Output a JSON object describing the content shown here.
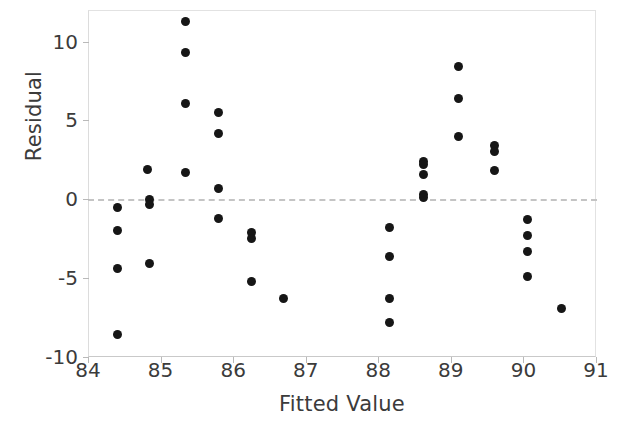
{
  "chart_data": {
    "type": "scatter",
    "title": "",
    "xlabel": "Fitted Value",
    "ylabel": "Residual",
    "xlim": [
      84,
      91
    ],
    "ylim": [
      -10,
      12
    ],
    "xticks": [
      84,
      85,
      86,
      87,
      88,
      89,
      90,
      91
    ],
    "xticklabels": [
      "84",
      "85",
      "86",
      "87",
      "88",
      "89",
      "90",
      "91"
    ],
    "yticks": [
      -10,
      -5,
      0,
      5,
      10
    ],
    "yticklabels": [
      "-10",
      "-5",
      "0",
      "5",
      "10"
    ],
    "grid": false,
    "reference_line": {
      "axis": "y",
      "value": 0,
      "style": "dashed",
      "color": "#c4c4c4"
    },
    "marker": {
      "shape": "circle",
      "color": "#161616",
      "size": 9
    },
    "x": [
      84.4,
      84.4,
      84.4,
      84.4,
      84.82,
      84.85,
      84.85,
      84.85,
      85.35,
      85.35,
      85.35,
      85.35,
      85.8,
      85.8,
      85.8,
      85.8,
      86.25,
      86.25,
      86.25,
      86.7,
      88.15,
      88.15,
      88.15,
      88.15,
      88.62,
      88.62,
      88.62,
      88.62,
      88.62,
      89.1,
      89.1,
      89.1,
      89.6,
      89.6,
      89.6,
      90.05,
      90.05,
      90.05,
      90.05,
      90.52
    ],
    "y": [
      -0.5,
      -2.0,
      -4.4,
      -8.6,
      1.9,
      0.0,
      -0.3,
      -4.1,
      11.3,
      9.3,
      6.1,
      1.7,
      5.5,
      4.2,
      0.7,
      -1.2,
      -2.1,
      -2.5,
      -5.2,
      -6.3,
      -1.8,
      -3.6,
      -6.3,
      -7.8,
      2.4,
      2.2,
      1.6,
      0.3,
      0.1,
      8.4,
      6.4,
      4.0,
      3.4,
      3.0,
      1.8,
      -1.3,
      -2.3,
      -3.3,
      -4.9,
      -6.9
    ],
    "n_points": 40
  }
}
